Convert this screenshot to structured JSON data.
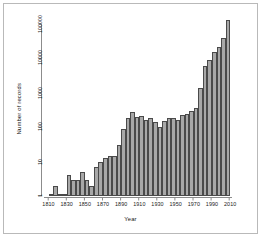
{
  "figure": {
    "background": "#ffffff",
    "frame_color": "#b9b9b9",
    "bar_fill": "#a8a8a8",
    "bar_stroke": "#4a4a4a",
    "axis_color": "#8c8c8c"
  },
  "chart_data": {
    "type": "bar",
    "title": "",
    "subtitle": "",
    "xlabel": "Year",
    "ylabel": "Number of records",
    "yscale": "log",
    "ylim": [
      1,
      300000
    ],
    "xlim": [
      1805,
      2012
    ],
    "grid": false,
    "legend": null,
    "y_ticks": [
      1,
      10,
      100,
      1000,
      10000,
      100000
    ],
    "y_tick_labels": [
      "1",
      "10",
      "100",
      "1000",
      "10000",
      "100000"
    ],
    "x_ticks": [
      1810,
      1830,
      1850,
      1870,
      1890,
      1910,
      1930,
      1950,
      1970,
      1990,
      2010
    ],
    "x_tick_labels": [
      "1810",
      "1830",
      "1850",
      "1870",
      "1890",
      "1910",
      "1930",
      "1950",
      "1970",
      "1990",
      "2010"
    ],
    "bin_width": 5,
    "categories": [
      "1810",
      "1815",
      "1820",
      "1825",
      "1830",
      "1835",
      "1840",
      "1845",
      "1850",
      "1855",
      "1860",
      "1865",
      "1870",
      "1875",
      "1880",
      "1885",
      "1890",
      "1895",
      "1900",
      "1905",
      "1910",
      "1915",
      "1920",
      "1925",
      "1930",
      "1935",
      "1940",
      "1945",
      "1950",
      "1955",
      "1960",
      "1965",
      "1970",
      "1975",
      "1980",
      "1985",
      "1990",
      "1995",
      "2000",
      "2005"
    ],
    "values": [
      1,
      2,
      1,
      1,
      4,
      3,
      3,
      5,
      3,
      2,
      7,
      10,
      13,
      15,
      15,
      30,
      90,
      180,
      280,
      200,
      210,
      160,
      180,
      140,
      100,
      150,
      190,
      190,
      160,
      230,
      250,
      290,
      370,
      1400,
      6000,
      9000,
      15000,
      22000,
      40000,
      130000
    ],
    "n_bars": 40
  }
}
